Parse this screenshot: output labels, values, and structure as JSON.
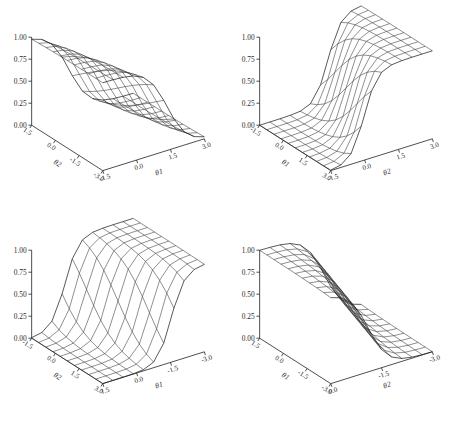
{
  "figure": {
    "background": "#ffffff",
    "line_color": "#333333",
    "panel_count": 4
  },
  "chart_data": [
    {
      "type": "line",
      "panel_index": 0,
      "title": "",
      "zlabel": "Probability",
      "xlabel": "θ2",
      "ylabel": "θ1",
      "zlim": [
        0,
        1
      ],
      "zticks": [
        "0.00",
        "0.25",
        "0.50",
        "0.75",
        "1.00"
      ],
      "ztick_values": [
        0,
        0.25,
        0.5,
        0.75,
        1
      ],
      "xticks": [
        "1.5",
        "0.0",
        "-1.5",
        "-3.0"
      ],
      "xtick_values": [
        1.5,
        0,
        -1.5,
        -3
      ],
      "yticks": [
        "-1.5",
        "0.0",
        "1.5",
        "3.0"
      ],
      "ytick_values": [
        -1.5,
        0,
        1.5,
        3
      ],
      "grid": false,
      "legend": "none",
      "surface": {
        "model": "2pl-logistic",
        "a1": 1.7,
        "a2": 0.45,
        "b": 0.0,
        "n": 11,
        "domain": [
          -3,
          3
        ]
      },
      "view": {
        "azimuth": 35,
        "elevation": 22,
        "x_sign": -1,
        "y_sign": 1
      }
    },
    {
      "type": "line",
      "panel_index": 1,
      "title": "",
      "zlabel": "Probability",
      "xlabel": "θ1",
      "ylabel": "θ2",
      "zlim": [
        0,
        1
      ],
      "zticks": [
        "0.00",
        "0.25",
        "0.50",
        "0.75",
        "1.00"
      ],
      "ztick_values": [
        0,
        0.25,
        0.5,
        0.75,
        1
      ],
      "xticks": [
        "-1.5",
        "0.0",
        "1.5",
        "3.0"
      ],
      "xtick_values": [
        -1.5,
        0,
        1.5,
        3
      ],
      "yticks": [
        "-1.5",
        "0.0",
        "1.5",
        "3.0"
      ],
      "ytick_values": [
        -1.5,
        0,
        1.5,
        3
      ],
      "grid": false,
      "legend": "none",
      "surface": {
        "model": "2pl-logistic",
        "a1": 2.6,
        "a2": 0.9,
        "b": 0.0,
        "n": 11,
        "domain": [
          -3,
          3
        ]
      },
      "view": {
        "azimuth": 35,
        "elevation": 22,
        "x_sign": 1,
        "y_sign": 1
      }
    },
    {
      "type": "line",
      "panel_index": 2,
      "title": "",
      "zlabel": "Probability",
      "xlabel": "θ2",
      "ylabel": "θ1",
      "zlim": [
        0,
        1
      ],
      "zticks": [
        "0.00",
        "0.25",
        "0.50",
        "0.75",
        "1.00"
      ],
      "ztick_values": [
        0,
        0.25,
        0.5,
        0.75,
        1
      ],
      "xticks": [
        "-1.5",
        "0.0",
        "1.5",
        "3.0"
      ],
      "xtick_values": [
        -1.5,
        0,
        1.5,
        3
      ],
      "yticks": [
        "1.5",
        "0.0",
        "-1.5",
        "-3.0"
      ],
      "ytick_values": [
        1.5,
        0,
        -1.5,
        -3
      ],
      "grid": false,
      "legend": "none",
      "surface": {
        "model": "2pl-logistic",
        "a1": 2.6,
        "a2": 0.9,
        "b": 0.0,
        "n": 11,
        "domain": [
          -3,
          3
        ]
      },
      "view": {
        "azimuth": 35,
        "elevation": 22,
        "x_sign": 1,
        "y_sign": -1
      }
    },
    {
      "type": "line",
      "panel_index": 3,
      "title": "",
      "zlabel": "Probability",
      "xlabel": "θ1",
      "ylabel": "θ2",
      "zlim": [
        0,
        1
      ],
      "zticks": [
        "0.00",
        "0.25",
        "0.50",
        "0.75",
        "1.00"
      ],
      "ztick_values": [
        0,
        0.25,
        0.5,
        0.75,
        1
      ],
      "xticks": [
        "1.5",
        "0.0",
        "-1.5",
        "-3.0"
      ],
      "xtick_values": [
        1.5,
        0,
        -1.5,
        -3
      ],
      "yticks": [
        "0.0",
        "-1.5",
        "-3.0"
      ],
      "ytick_values": [
        0,
        -1.5,
        -3
      ],
      "grid": false,
      "legend": "none",
      "surface": {
        "model": "2pl-logistic",
        "a1": 1.7,
        "a2": 0.45,
        "b": 0.0,
        "n": 11,
        "domain": [
          -3,
          3
        ]
      },
      "view": {
        "azimuth": 35,
        "elevation": 22,
        "x_sign": -1,
        "y_sign": -1
      }
    }
  ],
  "caption": ""
}
